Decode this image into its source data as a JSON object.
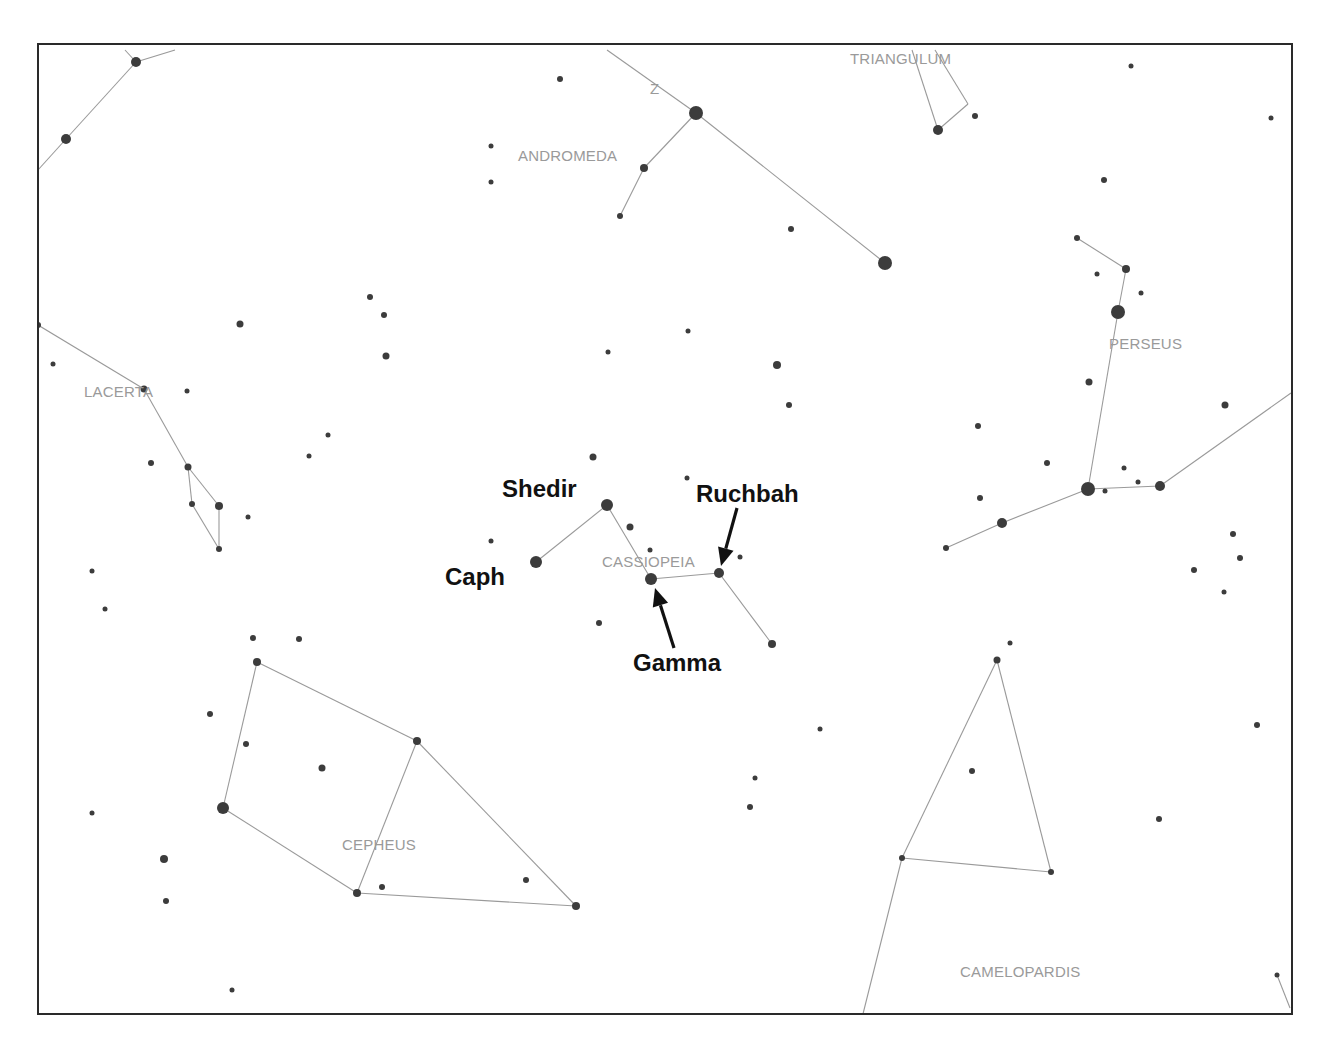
{
  "diagram": {
    "frame": {
      "x": 38,
      "y": 44,
      "width": 1254,
      "height": 970
    },
    "colors": {
      "star": "#3c3c3c",
      "line": "#9a9a9a",
      "const_label": "#9a9a9a",
      "annotation": "#111111",
      "frame": "#2a2a2a"
    },
    "constellation_labels": [
      {
        "name": "TRIANGULUM",
        "x": 850,
        "y": 64
      },
      {
        "name": "ANDROMEDA",
        "x": 518,
        "y": 161
      },
      {
        "name": "PERSEUS",
        "x": 1109,
        "y": 349
      },
      {
        "name": "LACERTA",
        "x": 84,
        "y": 397
      },
      {
        "name": "CASSIOPEIA",
        "x": 602,
        "y": 567
      },
      {
        "name": "CEPHEUS",
        "x": 342,
        "y": 850
      },
      {
        "name": "CAMELOPARDIS",
        "x": 960,
        "y": 977
      },
      {
        "name": "Z",
        "x": 650,
        "y": 94
      }
    ],
    "star_labels": [
      {
        "name": "Shedir",
        "x": 502,
        "y": 497
      },
      {
        "name": "Caph",
        "x": 445,
        "y": 585
      },
      {
        "name": "Ruchbah",
        "x": 696,
        "y": 502
      },
      {
        "name": "Gamma",
        "x": 633,
        "y": 671
      }
    ],
    "arrows": [
      {
        "target": "Ruchbah",
        "x1": 737,
        "y1": 508,
        "x2": 721,
        "y2": 566
      },
      {
        "target": "Gamma",
        "x1": 674,
        "y1": 648,
        "x2": 655,
        "y2": 588
      }
    ],
    "lines": [
      [
        38,
        170,
        66,
        139
      ],
      [
        66,
        139,
        136,
        62
      ],
      [
        136,
        62,
        175,
        50
      ],
      [
        125,
        50,
        136,
        62
      ],
      [
        607,
        50,
        696,
        113
      ],
      [
        696,
        113,
        885,
        263
      ],
      [
        696,
        113,
        644,
        168
      ],
      [
        644,
        168,
        620,
        216
      ],
      [
        912,
        50,
        938,
        130
      ],
      [
        938,
        130,
        968,
        104
      ],
      [
        968,
        104,
        935,
        50
      ],
      [
        1077,
        238,
        1126,
        269
      ],
      [
        1126,
        269,
        1118,
        312
      ],
      [
        1118,
        312,
        1088,
        489
      ],
      [
        1088,
        489,
        1160,
        486
      ],
      [
        1160,
        486,
        1291,
        393
      ],
      [
        1088,
        489,
        1002,
        523
      ],
      [
        1002,
        523,
        946,
        548
      ],
      [
        38,
        325,
        144,
        389
      ],
      [
        144,
        389,
        188,
        467
      ],
      [
        188,
        467,
        219,
        506
      ],
      [
        188,
        467,
        192,
        504
      ],
      [
        192,
        504,
        219,
        549
      ],
      [
        219,
        506,
        219,
        549
      ],
      [
        536,
        562,
        607,
        505
      ],
      [
        607,
        505,
        651,
        579
      ],
      [
        651,
        579,
        719,
        573
      ],
      [
        719,
        573,
        772,
        644
      ],
      [
        257,
        662,
        417,
        741
      ],
      [
        257,
        662,
        223,
        808
      ],
      [
        223,
        808,
        357,
        893
      ],
      [
        357,
        893,
        417,
        741
      ],
      [
        417,
        741,
        576,
        906
      ],
      [
        357,
        893,
        576,
        906
      ],
      [
        997,
        660,
        902,
        858
      ],
      [
        997,
        660,
        1051,
        872
      ],
      [
        902,
        858,
        1051,
        872
      ],
      [
        902,
        858,
        863,
        1014
      ],
      [
        1277,
        975,
        1290,
        1008
      ]
    ],
    "stars": [
      [
        136,
        62,
        5
      ],
      [
        66,
        139,
        5
      ],
      [
        38,
        325,
        3
      ],
      [
        240,
        324,
        3.5
      ],
      [
        370,
        297,
        3
      ],
      [
        384,
        315,
        3
      ],
      [
        386,
        356,
        3.5
      ],
      [
        53,
        364,
        2.5
      ],
      [
        187,
        391,
        2.5
      ],
      [
        144,
        389,
        3.5
      ],
      [
        151,
        463,
        3
      ],
      [
        188,
        467,
        3.5
      ],
      [
        192,
        504,
        3
      ],
      [
        219,
        506,
        4
      ],
      [
        219,
        549,
        3
      ],
      [
        248,
        517,
        2.5
      ],
      [
        328,
        435,
        2.5
      ],
      [
        309,
        456,
        2.5
      ],
      [
        92,
        571,
        2.5
      ],
      [
        105,
        609,
        2.5
      ],
      [
        253,
        638,
        3
      ],
      [
        299,
        639,
        3
      ],
      [
        560,
        79,
        3
      ],
      [
        491,
        146,
        2.5
      ],
      [
        491,
        182,
        2.5
      ],
      [
        696,
        113,
        7
      ],
      [
        644,
        168,
        4
      ],
      [
        620,
        216,
        3
      ],
      [
        791,
        229,
        3
      ],
      [
        885,
        263,
        7
      ],
      [
        608,
        352,
        2.5
      ],
      [
        688,
        331,
        2.5
      ],
      [
        777,
        365,
        4
      ],
      [
        789,
        405,
        3
      ],
      [
        938,
        130,
        5
      ],
      [
        975,
        116,
        3
      ],
      [
        1131,
        66,
        2.5
      ],
      [
        1271,
        118,
        2.5
      ],
      [
        1104,
        180,
        3
      ],
      [
        1077,
        238,
        3
      ],
      [
        1126,
        269,
        4
      ],
      [
        1097,
        274,
        2.5
      ],
      [
        1141,
        293,
        2.5
      ],
      [
        1118,
        312,
        7
      ],
      [
        1089,
        382,
        3.5
      ],
      [
        978,
        426,
        3
      ],
      [
        1225,
        405,
        3.5
      ],
      [
        1047,
        463,
        3
      ],
      [
        1124,
        468,
        2.5
      ],
      [
        1138,
        482,
        2.5
      ],
      [
        1105,
        491,
        2.5
      ],
      [
        1088,
        489,
        7
      ],
      [
        1160,
        486,
        5
      ],
      [
        980,
        498,
        3
      ],
      [
        1002,
        523,
        5
      ],
      [
        946,
        548,
        3
      ],
      [
        1233,
        534,
        3
      ],
      [
        1240,
        558,
        3
      ],
      [
        1194,
        570,
        3
      ],
      [
        1224,
        592,
        2.5
      ],
      [
        593,
        457,
        3.5
      ],
      [
        687,
        478,
        2.5
      ],
      [
        607,
        505,
        6
      ],
      [
        630,
        527,
        3.5
      ],
      [
        491,
        541,
        2.5
      ],
      [
        536,
        562,
        6
      ],
      [
        651,
        579,
        6
      ],
      [
        719,
        573,
        5
      ],
      [
        740,
        557,
        2.5
      ],
      [
        650,
        550,
        2.5
      ],
      [
        599,
        623,
        3
      ],
      [
        772,
        644,
        4
      ],
      [
        820,
        729,
        2.5
      ],
      [
        257,
        662,
        4
      ],
      [
        210,
        714,
        3
      ],
      [
        246,
        744,
        3
      ],
      [
        322,
        768,
        3.5
      ],
      [
        417,
        741,
        4
      ],
      [
        92,
        813,
        2.5
      ],
      [
        223,
        808,
        6
      ],
      [
        164,
        859,
        4
      ],
      [
        166,
        901,
        3
      ],
      [
        382,
        887,
        3
      ],
      [
        357,
        893,
        4
      ],
      [
        526,
        880,
        3
      ],
      [
        576,
        906,
        4
      ],
      [
        232,
        990,
        2.5
      ],
      [
        1010,
        643,
        2.5
      ],
      [
        997,
        660,
        3.5
      ],
      [
        972,
        771,
        3
      ],
      [
        1257,
        725,
        3
      ],
      [
        755,
        778,
        2.5
      ],
      [
        750,
        807,
        3
      ],
      [
        1159,
        819,
        3
      ],
      [
        902,
        858,
        3
      ],
      [
        1051,
        872,
        3
      ],
      [
        1277,
        975,
        2.5
      ]
    ]
  }
}
